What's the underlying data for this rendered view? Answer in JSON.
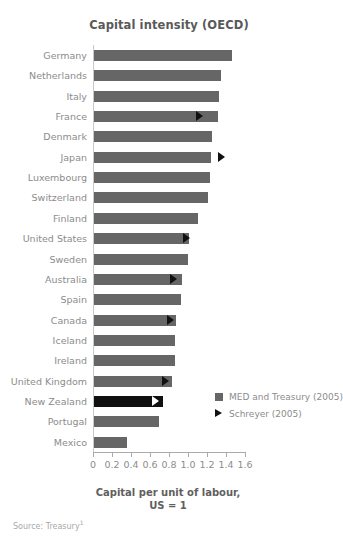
{
  "chart_data": {
    "type": "bar",
    "orientation": "horizontal",
    "title": "Capital intensity (OECD)",
    "xlabel_line1": "Capital per unit of labour,",
    "xlabel_line2": "US = 1",
    "ylabel": "",
    "xlim": [
      0,
      1.6
    ],
    "xticks": [
      0,
      0.2,
      0.4,
      0.6,
      0.8,
      1.0,
      1.2,
      1.4,
      1.6
    ],
    "xtick_labels": [
      "0",
      "0.2",
      "0.4",
      "0.6",
      "0.8",
      "1.0",
      "1.2",
      "1.4",
      "1.6"
    ],
    "grid": false,
    "legend_position": "right-lower",
    "categories": [
      "Germany",
      "Netherlands",
      "Italy",
      "France",
      "Denmark",
      "Japan",
      "Luxembourg",
      "Switzerland",
      "Finland",
      "United States",
      "Sweden",
      "Australia",
      "Spain",
      "Canada",
      "Iceland",
      "Ireland",
      "United Kingdom",
      "New Zealand",
      "Portugal",
      "Mexico"
    ],
    "series": [
      {
        "name": "MED and Treasury (2005)",
        "marker": "square",
        "color": "#666666",
        "highlight_color": "#101010",
        "values": [
          1.45,
          1.34,
          1.32,
          1.3,
          1.24,
          1.23,
          1.22,
          1.2,
          1.09,
          1.0,
          0.99,
          0.93,
          0.92,
          0.86,
          0.85,
          0.85,
          0.82,
          0.73,
          0.68,
          0.35
        ]
      },
      {
        "name": "Schreyer (2005)",
        "marker": "triangle",
        "color": "#111111",
        "values": [
          null,
          null,
          null,
          1.12,
          null,
          1.35,
          null,
          null,
          null,
          0.98,
          null,
          0.84,
          null,
          0.81,
          null,
          null,
          0.76,
          0.65,
          null,
          null
        ]
      }
    ],
    "highlighted_category": "New Zealand"
  },
  "legend": {
    "items": [
      {
        "label": "MED and Treasury (2005)",
        "marker": "square-marker-icon"
      },
      {
        "label": "Schreyer (2005)",
        "marker": "triangle-marker-icon"
      }
    ]
  },
  "footer": {
    "source_text": "Source: Treasury",
    "source_footnote": "1"
  }
}
